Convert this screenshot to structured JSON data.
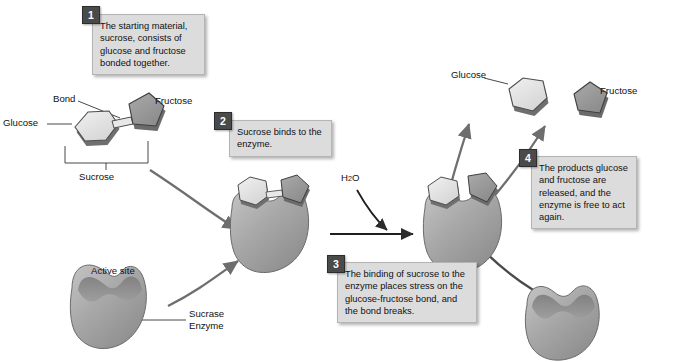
{
  "diagram": {
    "colors": {
      "callout_bg": "#dcdcdc",
      "badge_bg": "#4a4a4a",
      "enzyme_fill": "#a9a9a9",
      "glucose_fill": "#e2e2e2",
      "fructose_fill": "#9a9a9a",
      "arrow": "#6e6e6e"
    }
  },
  "callouts": [
    {
      "number": "1",
      "text": "The starting material, sucrose, consists of glucose and fructose bonded together."
    },
    {
      "number": "2",
      "text": "Sucrose binds to the enzyme."
    },
    {
      "number": "3",
      "text": "The binding of sucrose to the enzyme places stress on the glucose-fructose bond, and the bond breaks."
    },
    {
      "number": "4",
      "text": "The products glucose and fructose are released, and the enzyme is free to act again."
    }
  ],
  "labels": {
    "bond": "Bond",
    "glucose_substrate": "Glucose",
    "fructose_substrate": "Fructose",
    "sucrose_bracket": "Sucrose",
    "active_site": "Active site",
    "sucrase_enzyme": "Sucrase\nEnzyme",
    "water_main": "H",
    "water_sub": "2",
    "water_tail": "O",
    "glucose_product": "Glucose",
    "fructose_product": "Fructose"
  }
}
